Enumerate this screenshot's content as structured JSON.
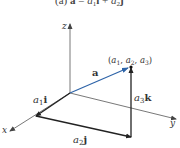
{
  "caption": {
    "prefix": "(a) ",
    "vector": "a",
    "equals": " = ",
    "term1_coef": "a",
    "term1_sub": "1",
    "term1_unit": "i",
    "plus": " + ",
    "term2_coef": "a",
    "term2_sub": "2",
    "term2_unit": "j"
  },
  "axes": {
    "x_label": "x",
    "y_label": "y",
    "z_label": "z"
  },
  "vector": {
    "label": "a",
    "color": "#2e64a8"
  },
  "point": {
    "open": "(",
    "c1": "a",
    "c1_sub": "1",
    "sep1": ", ",
    "c2": "a",
    "c2_sub": "2",
    "sep2": ", ",
    "c3": "a",
    "c3_sub": "3",
    "close": ")"
  },
  "components": {
    "a1i": {
      "coef": "a",
      "sub": "1",
      "unit": "i"
    },
    "a2j": {
      "coef": "a",
      "sub": "2",
      "unit": "j"
    },
    "a3k": {
      "coef": "a",
      "sub": "3",
      "unit": "k"
    }
  },
  "colors": {
    "axis": "#555555",
    "component": "#222222",
    "vector": "#2e64a8"
  }
}
